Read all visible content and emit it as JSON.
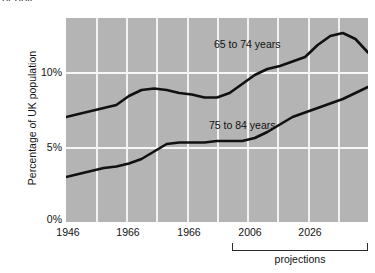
{
  "figure": {
    "clipped_caption_above": "people",
    "background_color": "#ffffff",
    "plot_background_color": "#b4b4b4",
    "gridline_color": "#f4f4f4",
    "line_color": "#111111"
  },
  "axes": {
    "ylabel": "Percentage of UK population",
    "yticks": [
      "10%",
      "5%",
      "0%"
    ],
    "ytick_values": [
      10,
      5,
      0
    ],
    "xticks": [
      "1946",
      "1966",
      "1966",
      "2006",
      "2026"
    ],
    "xtick_values": [
      1946,
      1966,
      1986,
      2006,
      2026
    ]
  },
  "annotations": {
    "series_label_upper": "65 to 74 years",
    "series_label_lower": "75 to 84 years",
    "projections_label": "projections"
  },
  "chart_data": {
    "type": "line",
    "title": "",
    "subtitle": "",
    "xlabel": "",
    "ylabel": "Percentage of UK population",
    "xlim": [
      1946,
      2066
    ],
    "ylim": [
      0,
      13.6
    ],
    "grid": true,
    "grid_x_every_years": 10,
    "ytick_labels": [
      "0%",
      "5%",
      "10%"
    ],
    "xtick_labels": [
      "1946",
      "1966",
      "1966",
      "2006",
      "2026"
    ],
    "legend": "inline annotations inside plot area",
    "projection_start_year": 2006,
    "projection_note": "projections",
    "series": [
      {
        "name": "65 to 74 years",
        "x": [
          1946,
          1951,
          1956,
          1961,
          1966,
          1971,
          1976,
          1981,
          1986,
          1991,
          1996,
          2001,
          2006,
          2011,
          2016,
          2021,
          2026,
          2031,
          2036,
          2041,
          2046,
          2051,
          2056,
          2061,
          2066
        ],
        "values": [
          7.0,
          7.2,
          7.4,
          7.6,
          7.8,
          8.4,
          8.8,
          8.9,
          8.8,
          8.6,
          8.5,
          8.3,
          8.3,
          8.6,
          9.2,
          9.8,
          10.2,
          10.4,
          10.7,
          11.0,
          11.8,
          12.4,
          12.6,
          12.2,
          11.3
        ]
      },
      {
        "name": "75 to 84 years",
        "x": [
          1946,
          1951,
          1956,
          1961,
          1966,
          1971,
          1976,
          1981,
          1986,
          1991,
          1996,
          2001,
          2006,
          2011,
          2016,
          2021,
          2026,
          2031,
          2036,
          2041,
          2046,
          2051,
          2056,
          2061,
          2066
        ],
        "values": [
          3.0,
          3.2,
          3.4,
          3.6,
          3.7,
          3.9,
          4.2,
          4.7,
          5.2,
          5.3,
          5.3,
          5.3,
          5.4,
          5.4,
          5.4,
          5.6,
          6.0,
          6.5,
          7.0,
          7.3,
          7.6,
          7.9,
          8.2,
          8.6,
          9.0
        ]
      }
    ]
  }
}
